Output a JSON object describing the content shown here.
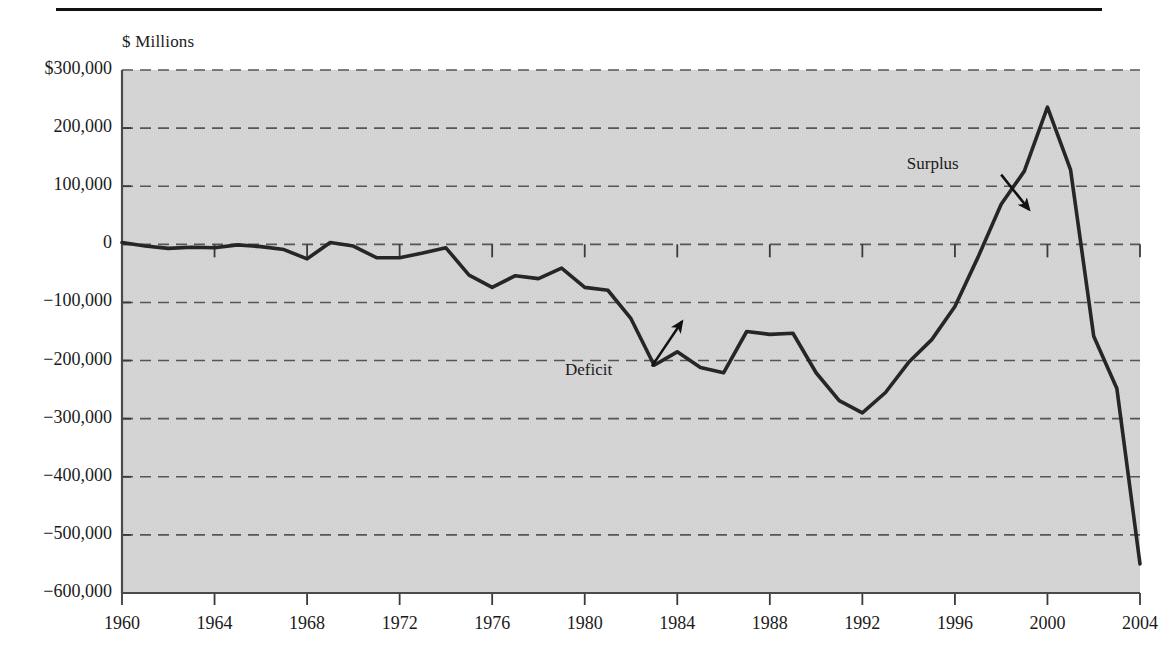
{
  "figure": {
    "unit_label": "$ Millions",
    "background_color": "#d4d4d4",
    "line_color": "#262626",
    "grid_color": "#555555",
    "axis_color": "#4a4a4a",
    "rule_color": "#111111"
  },
  "chart_data": {
    "type": "line",
    "title": "",
    "subtitle": "",
    "xlabel": "",
    "ylabel": "$ Millions",
    "grid": true,
    "grid_style": "dashed-horizontal",
    "legend": "none",
    "xlim": [
      1960,
      2004
    ],
    "ylim": [
      -600000,
      300000
    ],
    "ytick_labels": [
      "$300,000",
      "200,000",
      "100,000",
      "0",
      "−100,000",
      "−200,000",
      "−300,000",
      "−400,000",
      "−500,000",
      "−600,000"
    ],
    "yticks": [
      300000,
      200000,
      100000,
      0,
      -100000,
      -200000,
      -300000,
      -400000,
      -500000,
      -600000
    ],
    "xtick_labels": [
      "1960",
      "1964",
      "1968",
      "1972",
      "1976",
      "1980",
      "1984",
      "1988",
      "1992",
      "1996",
      "2000",
      "2004"
    ],
    "xticks": [
      1960,
      1964,
      1968,
      1972,
      1976,
      1980,
      1984,
      1988,
      1992,
      1996,
      2000,
      2004
    ],
    "annotations": [
      {
        "text": "Deficit",
        "label_x": 1982.0,
        "label_y": -218000,
        "arrow_from_x": 1982.9,
        "arrow_from_y": -210000,
        "arrow_to_x": 1984.2,
        "arrow_to_y": -133000
      },
      {
        "text": "Surplus",
        "label_x": 1996.6,
        "label_y": 137000,
        "arrow_from_x": 1998.0,
        "arrow_from_y": 120000,
        "arrow_to_x": 1999.2,
        "arrow_to_y": 60000
      }
    ],
    "series": [
      {
        "name": "Federal surplus or deficit",
        "x": [
          1960,
          1961,
          1962,
          1963,
          1964,
          1965,
          1966,
          1967,
          1968,
          1969,
          1970,
          1971,
          1972,
          1973,
          1974,
          1975,
          1976,
          1977,
          1978,
          1979,
          1980,
          1981,
          1982,
          1983,
          1984,
          1985,
          1986,
          1987,
          1988,
          1989,
          1990,
          1991,
          1992,
          1993,
          1994,
          1995,
          1996,
          1997,
          1998,
          1999,
          2000,
          2001,
          2002,
          2003,
          2004
        ],
        "values": [
          3000,
          -3000,
          -7000,
          -5000,
          -6000,
          -1000,
          -4000,
          -9000,
          -25000,
          3000,
          -3000,
          -23000,
          -23000,
          -15000,
          -6000,
          -53000,
          -74000,
          -54000,
          -59000,
          -41000,
          -74000,
          -79000,
          -128000,
          -208000,
          -185000,
          -212000,
          -221000,
          -150000,
          -155000,
          -153000,
          -221000,
          -269000,
          -290000,
          -255000,
          -203000,
          -164000,
          -107000,
          -22000,
          69000,
          126000,
          236000,
          128000,
          -158000,
          -248000,
          -550000
        ]
      }
    ]
  }
}
